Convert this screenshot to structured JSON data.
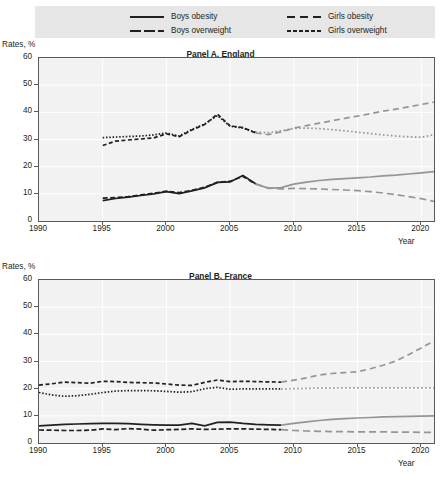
{
  "legend": {
    "items": [
      {
        "label": "Boys obesity",
        "style": "solid",
        "swatch_icon": "solid-line-icon"
      },
      {
        "label": "Boys overweight",
        "style": "long-dash",
        "swatch_icon": "long-dash-line-icon"
      },
      {
        "label": "Girls obesity",
        "style": "dash",
        "swatch_icon": "dash-line-icon"
      },
      {
        "label": "Girls overweight",
        "style": "dotted",
        "swatch_icon": "dotted-line-icon"
      }
    ]
  },
  "axis": {
    "y_label": "Rates, %",
    "x_label": "Year",
    "y_ticks": [
      "60",
      "50",
      "40",
      "30",
      "20",
      "10",
      "0"
    ],
    "x_ticks": [
      "1990",
      "1995",
      "2000",
      "2005",
      "2010",
      "2015",
      "2020"
    ]
  },
  "panels": [
    {
      "title": "Panel A. England"
    },
    {
      "title": "Panel B. France"
    }
  ],
  "colors": {
    "historical": "#231f20",
    "projection": "#939598",
    "plot_background": "#f2f2f2",
    "legend_background": "#e6e6e6",
    "axis": "#58595b",
    "gridline": "#ffffff"
  },
  "chart_data": [
    {
      "type": "line",
      "title": "Panel A. England",
      "xlabel": "Year",
      "ylabel": "Rates, %",
      "xlim": [
        1990,
        2021
      ],
      "ylim": [
        0,
        60
      ],
      "grid": true,
      "legend_position": "top",
      "projection_starts": 2007,
      "series": [
        {
          "name": "Boys obesity",
          "style": "solid",
          "x": [
            1995,
            1996,
            1997,
            1998,
            1999,
            2000,
            2001,
            2002,
            2003,
            2004,
            2005,
            2006,
            2007,
            2008,
            2009,
            2010,
            2011,
            2012,
            2013,
            2014,
            2015,
            2016,
            2017,
            2018,
            2019,
            2020,
            2021
          ],
          "values": [
            7.5,
            8.3,
            8.8,
            9.4,
            10.0,
            10.8,
            10.1,
            11.1,
            12.2,
            14.2,
            14.4,
            16.8,
            13.7,
            12.0,
            12.3,
            13.6,
            14.3,
            14.9,
            15.3,
            15.6,
            15.9,
            16.2,
            16.6,
            16.9,
            17.3,
            17.7,
            18.2
          ]
        },
        {
          "name": "Boys overweight",
          "style": "long-dash",
          "x": [
            1995,
            1996,
            1997,
            1998,
            1999,
            2000,
            2001,
            2002,
            2003,
            2004,
            2005,
            2006,
            2007,
            2008,
            2009,
            2010,
            2011,
            2012,
            2013,
            2014,
            2015,
            2016,
            2017,
            2018,
            2019,
            2020,
            2021
          ],
          "values": [
            8.4,
            8.6,
            9.0,
            9.6,
            10.2,
            11.0,
            10.4,
            11.3,
            12.4,
            14.2,
            14.6,
            16.4,
            13.6,
            12.2,
            11.8,
            12.0,
            11.9,
            11.8,
            11.6,
            11.4,
            11.2,
            10.8,
            10.3,
            9.7,
            9.0,
            8.2,
            7.2
          ]
        },
        {
          "name": "Girls obesity",
          "style": "dash",
          "x": [
            1995,
            1996,
            1997,
            1998,
            1999,
            2000,
            2001,
            2002,
            2003,
            2004,
            2005,
            2006,
            2007,
            2008,
            2009,
            2010,
            2011,
            2012,
            2013,
            2014,
            2015,
            2016,
            2017,
            2018,
            2019,
            2020,
            2021
          ],
          "values": [
            27.8,
            29.4,
            29.8,
            30.2,
            30.6,
            32.1,
            31.0,
            33.5,
            35.5,
            39.3,
            35.0,
            34.4,
            32.4,
            31.8,
            32.8,
            34.2,
            35.1,
            36.0,
            36.9,
            37.8,
            38.6,
            39.5,
            40.4,
            41.2,
            42.0,
            42.9,
            43.8
          ]
        },
        {
          "name": "Girls overweight",
          "style": "dotted",
          "x": [
            1995,
            1996,
            1997,
            1998,
            1999,
            2000,
            2001,
            2002,
            2003,
            2004,
            2005,
            2006,
            2007,
            2008,
            2009,
            2010,
            2011,
            2012,
            2013,
            2014,
            2015,
            2016,
            2017,
            2018,
            2019,
            2020,
            2021
          ],
          "values": [
            30.7,
            30.9,
            31.1,
            31.3,
            31.7,
            32.4,
            31.3,
            33.7,
            35.7,
            38.8,
            34.9,
            34.2,
            32.7,
            32.5,
            33.2,
            34.1,
            34.2,
            34.0,
            33.6,
            33.2,
            32.7,
            32.2,
            31.7,
            31.3,
            31.0,
            30.8,
            31.8
          ]
        }
      ]
    },
    {
      "type": "line",
      "title": "Panel B. France",
      "xlabel": "Year",
      "ylabel": "Rates, %",
      "xlim": [
        1990,
        2021
      ],
      "ylim": [
        0,
        60
      ],
      "grid": true,
      "legend_position": "top",
      "projection_starts": 2009,
      "series": [
        {
          "name": "Boys obesity",
          "style": "solid",
          "x": [
            1990,
            1991,
            1992,
            1993,
            1994,
            1995,
            1996,
            1997,
            1998,
            1999,
            2000,
            2001,
            2002,
            2003,
            2004,
            2005,
            2006,
            2007,
            2008,
            2009,
            2010,
            2011,
            2012,
            2013,
            2014,
            2015,
            2016,
            2017,
            2018,
            2019,
            2020,
            2021
          ],
          "values": [
            6.3,
            6.6,
            6.9,
            7.0,
            7.1,
            7.2,
            7.2,
            7.1,
            6.9,
            6.7,
            6.6,
            6.6,
            7.2,
            6.3,
            7.6,
            7.7,
            7.2,
            6.9,
            6.7,
            6.6,
            7.2,
            7.8,
            8.3,
            8.7,
            9.0,
            9.2,
            9.4,
            9.6,
            9.7,
            9.8,
            9.9,
            10.0
          ]
        },
        {
          "name": "Boys overweight",
          "style": "long-dash",
          "x": [
            1990,
            1991,
            1992,
            1993,
            1994,
            1995,
            1996,
            1997,
            1998,
            1999,
            2000,
            2001,
            2002,
            2003,
            2004,
            2005,
            2006,
            2007,
            2008,
            2009,
            2010,
            2011,
            2012,
            2013,
            2014,
            2015,
            2016,
            2017,
            2018,
            2019,
            2020,
            2021
          ],
          "values": [
            4.8,
            4.7,
            4.6,
            4.6,
            4.7,
            5.2,
            4.9,
            5.3,
            5.1,
            4.7,
            4.9,
            5.0,
            5.2,
            5.0,
            5.1,
            5.2,
            5.2,
            5.1,
            5.0,
            4.9,
            4.6,
            4.4,
            4.3,
            4.2,
            4.2,
            4.1,
            4.1,
            4.1,
            4.0,
            4.0,
            3.9,
            3.9
          ]
        },
        {
          "name": "Girls obesity",
          "style": "dash",
          "x": [
            1990,
            1991,
            1992,
            1993,
            1994,
            1995,
            1996,
            1997,
            1998,
            1999,
            2000,
            2001,
            2002,
            2003,
            2004,
            2005,
            2006,
            2007,
            2008,
            2009,
            2010,
            2011,
            2012,
            2013,
            2014,
            2015,
            2016,
            2017,
            2018,
            2019,
            2020,
            2021
          ],
          "values": [
            21.3,
            21.8,
            22.4,
            22.2,
            22.0,
            22.7,
            22.6,
            22.3,
            22.2,
            22.1,
            21.7,
            21.3,
            21.2,
            22.3,
            23.2,
            22.6,
            22.7,
            22.6,
            22.5,
            22.4,
            23.1,
            24.0,
            25.0,
            25.6,
            25.9,
            26.2,
            27.3,
            28.6,
            30.2,
            32.5,
            35.0,
            37.6
          ]
        },
        {
          "name": "Girls overweight",
          "style": "dotted",
          "x": [
            1990,
            1991,
            1992,
            1993,
            1994,
            1995,
            1996,
            1997,
            1998,
            1999,
            2000,
            2001,
            2002,
            2003,
            2004,
            2005,
            2006,
            2007,
            2008,
            2009,
            2010,
            2011,
            2012,
            2013,
            2014,
            2015,
            2016,
            2017,
            2018,
            2019,
            2020,
            2021
          ],
          "values": [
            18.6,
            17.7,
            17.2,
            17.4,
            17.9,
            18.6,
            19.1,
            19.3,
            19.3,
            19.2,
            19.0,
            18.7,
            18.9,
            20.0,
            20.5,
            19.8,
            19.9,
            19.9,
            19.9,
            19.9,
            20.0,
            20.1,
            20.2,
            20.2,
            20.3,
            20.3,
            20.3,
            20.3,
            20.3,
            20.3,
            20.3,
            20.3
          ]
        }
      ]
    }
  ]
}
